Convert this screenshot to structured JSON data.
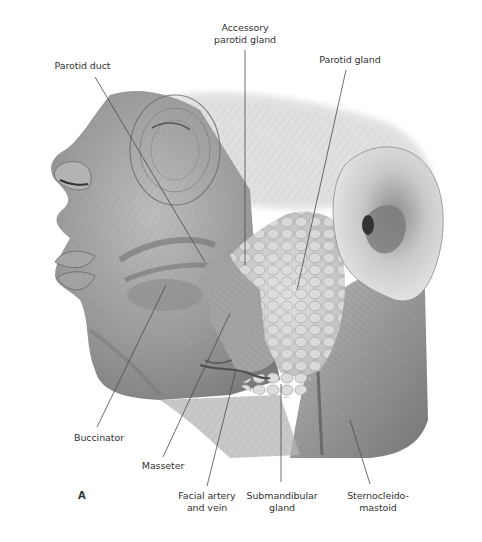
{
  "figure": {
    "panel_letter": "A",
    "colors": {
      "background": "#ffffff",
      "label_text": "#333333",
      "leader_line": "#4a4a4a",
      "muscle_dark": "#6e6e6e",
      "muscle_mid": "#9a9a9a",
      "muscle_light": "#c8c8c8",
      "gland": "#d9d9d9"
    }
  },
  "labels": [
    {
      "id": "parotid-duct",
      "text": "Parotid duct",
      "x": 45,
      "y": 60,
      "w": 75,
      "line": [
        95,
        77,
        205,
        262
      ]
    },
    {
      "id": "accessory-parotid-gland",
      "text": "Accessory\nparotid gland",
      "x": 205,
      "y": 22,
      "w": 80,
      "line": [
        245,
        50,
        245,
        265
      ]
    },
    {
      "id": "parotid-gland",
      "text": "Parotid gland",
      "x": 310,
      "y": 54,
      "w": 80,
      "line": [
        346,
        70,
        297,
        290
      ]
    },
    {
      "id": "buccinator",
      "text": "Buccinator",
      "x": 68,
      "y": 432,
      "w": 62,
      "line": [
        97,
        427,
        166,
        285
      ]
    },
    {
      "id": "masseter",
      "text": "Masseter",
      "x": 132,
      "y": 460,
      "w": 62,
      "line": [
        163,
        457,
        230,
        313
      ]
    },
    {
      "id": "facial-artery-and-vein",
      "text": "Facial artery\nand vein",
      "x": 172,
      "y": 490,
      "w": 70,
      "line": [
        207,
        486,
        236,
        370
      ]
    },
    {
      "id": "submandibular-gland",
      "text": "Submandibular\ngland",
      "x": 242,
      "y": 490,
      "w": 80,
      "line": [
        281,
        482,
        281,
        384
      ]
    },
    {
      "id": "sternocleidomastoid",
      "text": "Sternocleido-\nmastoid",
      "x": 340,
      "y": 490,
      "w": 76,
      "line": [
        370,
        484,
        350,
        420
      ]
    }
  ]
}
